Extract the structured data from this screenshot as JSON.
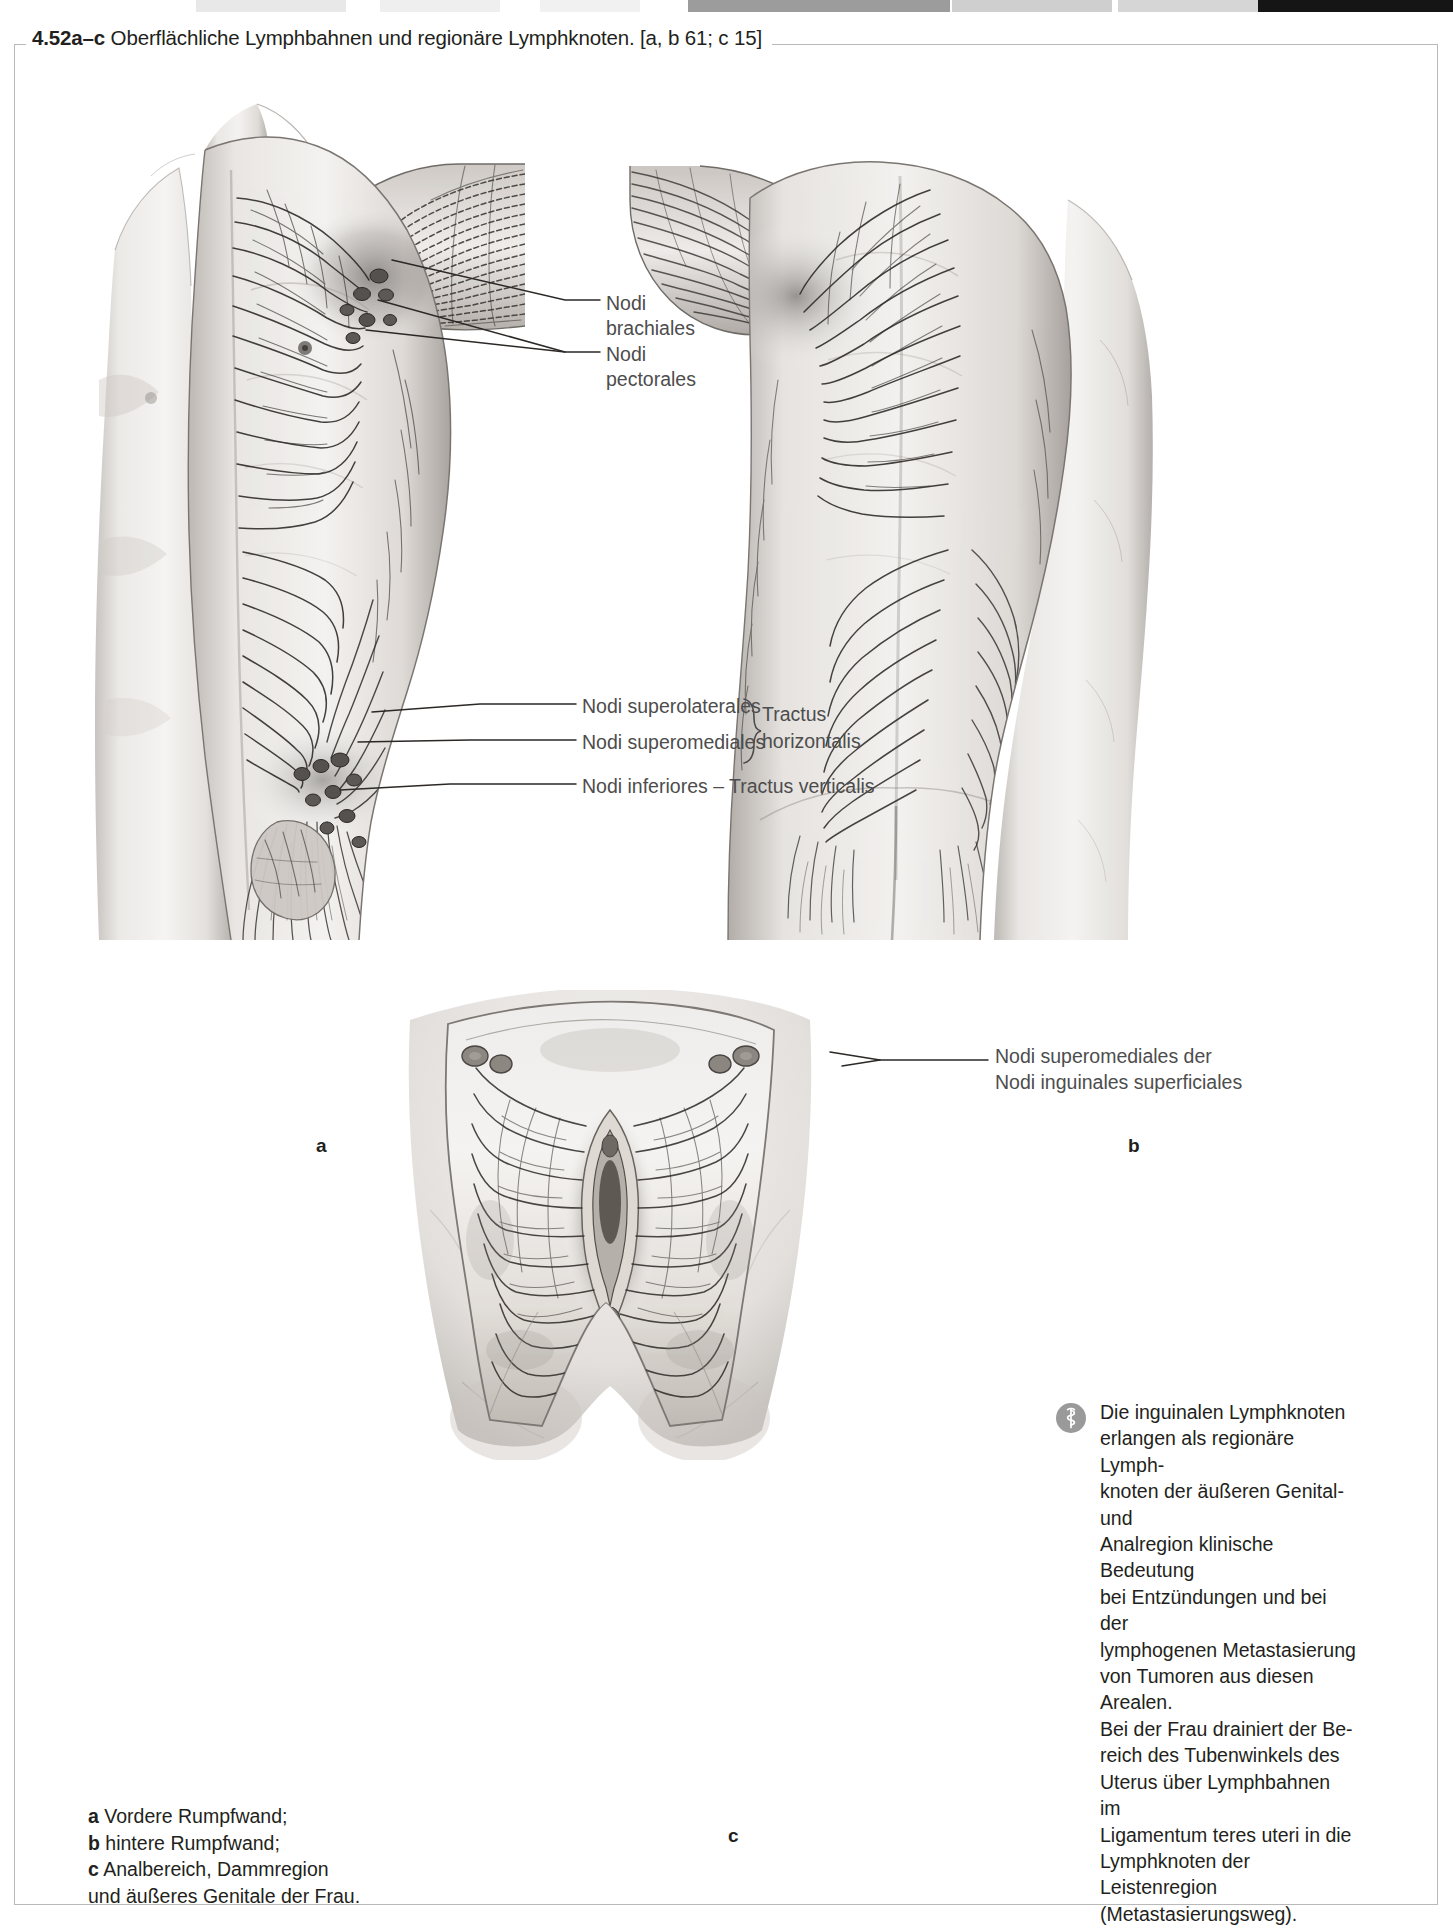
{
  "figure": {
    "number": "4.52a–c",
    "title": "Oberflächliche Lymphbahnen und regionäre Lymphknoten.",
    "source_refs": "[a, b 61; c 15]"
  },
  "panels": {
    "a": {
      "letter": "a",
      "description": "Vordere Rumpfwand"
    },
    "b": {
      "letter": "b",
      "description": "hintere Rumpfwand"
    },
    "c": {
      "letter": "c",
      "description": "Analbereich, Dammregion und äußeres Genitale der Frau"
    }
  },
  "labels": {
    "nodi_brachiales_l1": "Nodi",
    "nodi_brachiales_l2": "brachiales",
    "nodi_pectorales_l1": "Nodi",
    "nodi_pectorales_l2": "pectorales",
    "nodi_superolaterales": "Nodi superolaterales",
    "nodi_superomediales": "Nodi superomediales",
    "nodi_inferiores": "Nodi inferiores – Tractus verticalis",
    "tractus_horizontalis_l1": "Tractus",
    "tractus_horizontalis_l2": "horizontalis",
    "panel_c_nodes_l1": "Nodi superomediales der",
    "panel_c_nodes_l2": "Nodi inguinales superficiales"
  },
  "clinical_note": {
    "icon": "clinical-caduceus-icon",
    "lines": [
      "Die inguinalen Lymphknoten",
      "erlangen als regionäre Lymph-",
      "knoten der äußeren Genital- und",
      "Analregion klinische Bedeutung",
      "bei Entzündungen und bei der",
      "lymphogenen Metastasierung",
      "von Tumoren aus diesen Arealen.",
      "Bei der Frau drainiert der Be-",
      "reich des Tubenwinkels des",
      "Uterus über Lymphbahnen im",
      "Ligamentum teres uteri in die",
      "Lymphknoten der Leistenregion",
      "(Metastasierungsweg)."
    ]
  },
  "caption": {
    "a_key": "a",
    "a_text": "Vordere Rumpfwand;",
    "b_key": "b",
    "b_text": "hintere Rumpfwand;",
    "c_key": "c",
    "c_text": "Analbereich, Dammregion",
    "c_text_cont": "und äußeres Genitale der Frau."
  },
  "colors": {
    "text": "#231f20",
    "label_text": "#4d4d4d",
    "rule": "#b9b9b9",
    "icon_bg": "#9a9a9a",
    "ink": "#2b2b2b",
    "skin_light": "#f2f0ee",
    "skin_mid": "#d8d4d0",
    "skin_dark": "#9a9590"
  }
}
